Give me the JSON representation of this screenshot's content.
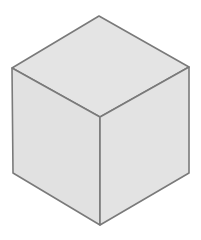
{
  "diagram": {
    "shape": "isometric-cube",
    "colors": {
      "background": "#ffffff",
      "face_top": "#e4e4e4",
      "face_left": "#e1e1e1",
      "face_right": "#e3e3e3",
      "stroke": "#7a7a7a"
    },
    "vertices": {
      "top": [
        99,
        16
      ],
      "left": [
        12,
        68
      ],
      "right": [
        189,
        67
      ],
      "center": [
        100,
        117
      ],
      "bottom_left": [
        13,
        173
      ],
      "bottom_right": [
        189,
        173
      ],
      "bottom": [
        100,
        225
      ]
    }
  }
}
